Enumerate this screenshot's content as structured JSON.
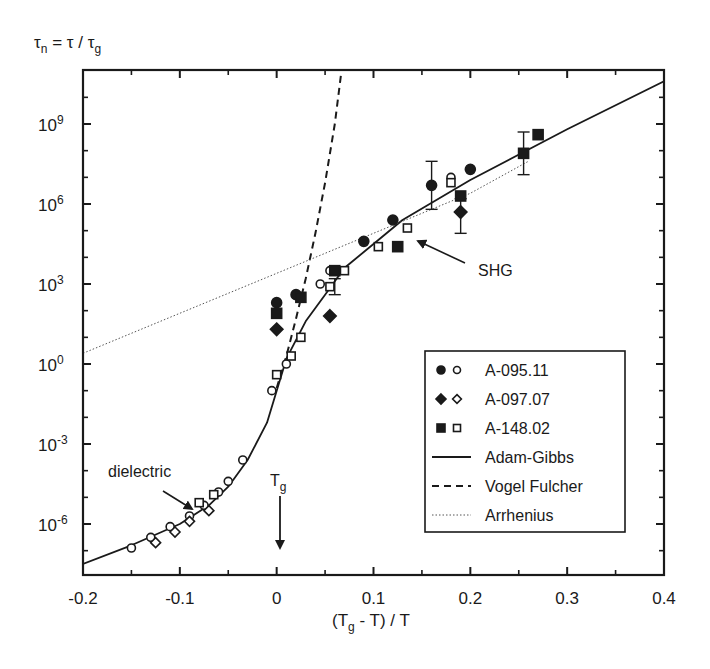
{
  "chart_data": {
    "type": "scatter",
    "title": "",
    "ylabel": "τn = τ / τg",
    "xlabel": "(Tg - T) / T",
    "xlim": [
      -0.2,
      0.4
    ],
    "ylim_log10": [
      -7.9,
      11.0
    ],
    "yscale": "log",
    "grid": false,
    "x_ticks": [
      "-0.2",
      "-0.1",
      "0",
      "0.1",
      "0.2",
      "0.3",
      "0.4"
    ],
    "y_ticks": [
      {
        "base": "10",
        "exp": "9"
      },
      {
        "base": "10",
        "exp": "6"
      },
      {
        "base": "10",
        "exp": "3"
      },
      {
        "base": "10",
        "exp": "0"
      },
      {
        "base": "10",
        "exp": "-3"
      },
      {
        "base": "10",
        "exp": "-6"
      }
    ],
    "legend_position": "lower right",
    "legend": [
      {
        "label": "A-095.11",
        "marker": "circle"
      },
      {
        "label": "A-097.07",
        "marker": "diamond"
      },
      {
        "label": "A-148.02",
        "marker": "square"
      },
      {
        "label": "Adam-Gibbs",
        "line": "solid"
      },
      {
        "label": "Vogel Fulcher",
        "line": "dashed"
      },
      {
        "label": "Arrhenius",
        "line": "dotted"
      }
    ],
    "annotations": [
      {
        "text": "dielectric",
        "x": -0.135,
        "log10_y": -2.1,
        "arrow_to": [
          -0.07,
          -4.5
        ]
      },
      {
        "text": "SHG",
        "x": 0.22,
        "log10_y": 4.2,
        "arrow_to": [
          0.135,
          5.3
        ]
      },
      {
        "text": "Tg",
        "x": 0.0,
        "log10_y": -5.0,
        "arrow_to": [
          0.0,
          -7.3
        ]
      }
    ],
    "series": [
      {
        "name": "Adam-Gibbs",
        "kind": "line",
        "style": "solid",
        "x": [
          -0.2,
          -0.15,
          -0.1,
          -0.07,
          -0.05,
          -0.03,
          -0.01,
          0.0,
          0.01,
          0.03,
          0.05,
          0.07,
          0.1,
          0.13,
          0.2,
          0.3,
          0.4
        ],
        "log10_y": [
          -7.5,
          -6.8,
          -6.0,
          -5.3,
          -4.6,
          -3.6,
          -2.2,
          -1.0,
          0.2,
          1.6,
          2.6,
          3.6,
          4.5,
          5.4,
          6.9,
          8.8,
          10.6
        ]
      },
      {
        "name": "Vogel Fulcher",
        "kind": "line",
        "style": "dashed",
        "x": [
          0.0,
          0.01,
          0.02,
          0.03,
          0.04,
          0.05,
          0.06,
          0.067
        ],
        "log10_y": [
          -0.9,
          0.3,
          1.7,
          3.2,
          4.9,
          6.8,
          9.0,
          11.0
        ]
      },
      {
        "name": "Arrhenius",
        "kind": "line",
        "style": "dotted",
        "x": [
          -0.2,
          -0.1,
          0.0,
          0.1,
          0.2,
          0.26
        ],
        "log10_y": [
          0.4,
          1.9,
          3.4,
          4.9,
          6.4,
          7.6
        ]
      },
      {
        "name": "A-095.11 (filled)",
        "kind": "points",
        "marker": "circle",
        "filled": true,
        "x": [
          0.0,
          0.02,
          0.09,
          0.12,
          0.16,
          0.2
        ],
        "log10_y": [
          2.3,
          2.6,
          4.6,
          5.4,
          6.7,
          7.3
        ]
      },
      {
        "name": "A-095.11 (open)",
        "kind": "points",
        "marker": "circle",
        "filled": false,
        "x": [
          -0.15,
          -0.13,
          -0.11,
          -0.09,
          -0.075,
          -0.06,
          -0.05,
          -0.035,
          -0.005,
          0.01,
          0.045,
          0.055,
          0.18
        ],
        "log10_y": [
          -6.9,
          -6.5,
          -6.1,
          -5.7,
          -5.3,
          -4.8,
          -4.4,
          -3.6,
          -1.0,
          0.0,
          3.0,
          3.5,
          7.0
        ]
      },
      {
        "name": "A-097.07 (filled)",
        "kind": "points",
        "marker": "diamond",
        "filled": true,
        "x": [
          -0.0,
          0.055,
          0.19
        ],
        "log10_y": [
          1.3,
          1.8,
          5.7
        ]
      },
      {
        "name": "A-097.07 (open)",
        "kind": "points",
        "marker": "diamond",
        "filled": false,
        "x": [
          -0.125,
          -0.105,
          -0.09,
          -0.07
        ],
        "log10_y": [
          -6.7,
          -6.3,
          -5.9,
          -5.5
        ]
      },
      {
        "name": "A-148.02 (filled)",
        "kind": "points",
        "marker": "square",
        "filled": true,
        "x": [
          0.0,
          0.025,
          0.06,
          0.125,
          0.19,
          0.255,
          0.27
        ],
        "log10_y": [
          1.9,
          2.5,
          3.5,
          4.4,
          6.3,
          7.9,
          8.6
        ]
      },
      {
        "name": "A-148.02 (open)",
        "kind": "points",
        "marker": "square",
        "filled": false,
        "x": [
          -0.08,
          -0.065,
          0.0,
          0.015,
          0.025,
          0.055,
          0.07,
          0.105,
          0.135,
          0.18
        ],
        "log10_y": [
          -5.2,
          -4.9,
          -0.4,
          0.3,
          1.0,
          2.9,
          3.5,
          4.4,
          5.1,
          6.8
        ]
      }
    ],
    "error_bars": [
      {
        "x": 0.16,
        "log10_y": 6.7,
        "low": 5.8,
        "high": 7.6
      },
      {
        "x": 0.19,
        "log10_y": 5.7,
        "low": 4.9,
        "high": 6.2
      },
      {
        "x": 0.255,
        "log10_y": 7.9,
        "low": 7.1,
        "high": 8.7
      },
      {
        "x": 0.06,
        "log10_y": 2.9,
        "low": 2.6,
        "high": 3.2
      }
    ]
  },
  "labels": {
    "ylabel_main": "τ",
    "ylabel_sub": "n",
    "ylabel_mid": " = τ / τ",
    "ylabel_sub2": "g",
    "xlabel_pre": "(T",
    "xlabel_sub": "g",
    "xlabel_post": " - T) / T",
    "tg_main": "T",
    "tg_sub": "g",
    "dielectric": "dielectric",
    "shg": "SHG"
  }
}
